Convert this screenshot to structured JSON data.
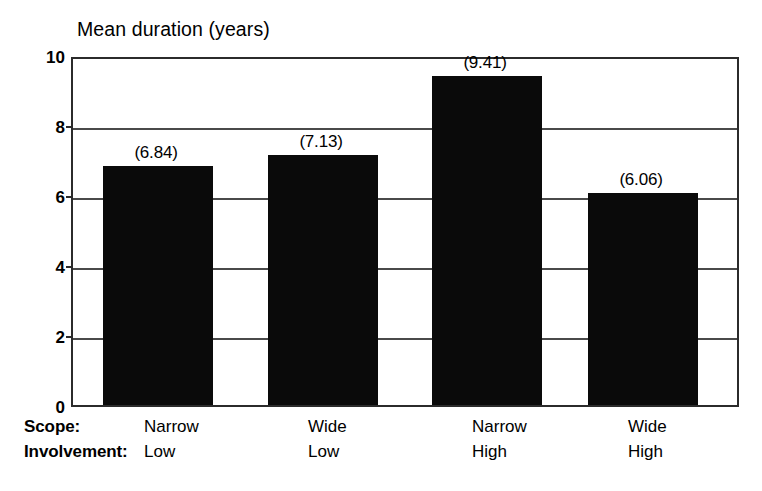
{
  "chart_data": {
    "type": "bar",
    "title": "Mean duration (years)",
    "xlabel": "",
    "ylabel": "",
    "ylim": [
      0,
      10
    ],
    "yticks": [
      "0",
      "2",
      "4",
      "6",
      "8",
      "10"
    ],
    "grid": true,
    "legend": "none",
    "orientation": "vertical",
    "bar_color": "#0a0a0a",
    "categories": [
      "Narrow\nLow",
      "Wide\nLow",
      "Narrow\nHigh",
      "Wide\nHigh"
    ],
    "values": [
      6.84,
      7.13,
      9.41,
      6.06
    ],
    "value_labels": [
      "(6.84)",
      "(7.13)",
      "(9.41)",
      "(6.06)"
    ],
    "category_rows": [
      {
        "header": "Scope:",
        "cells": [
          "Narrow",
          "Wide",
          "Narrow",
          "Wide"
        ]
      },
      {
        "header": "Involvement:",
        "cells": [
          "Low",
          "Low",
          "High",
          "High"
        ]
      }
    ]
  },
  "axis": {
    "y_ticks": [
      {
        "label": "10",
        "value": 10
      },
      {
        "label": "8",
        "value": 8
      },
      {
        "label": "6",
        "value": 6
      },
      {
        "label": "4",
        "value": 4
      },
      {
        "label": "2",
        "value": 2
      },
      {
        "label": "0",
        "value": 0
      }
    ]
  }
}
